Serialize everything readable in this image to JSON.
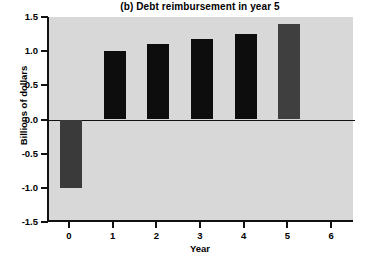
{
  "chart_data": {
    "type": "bar",
    "title": "(b) Debt reimbursement in year 5",
    "xlabel": "Year",
    "ylabel": "Billions of dollars",
    "categories": [
      "0",
      "1",
      "2",
      "3",
      "4",
      "5",
      "6"
    ],
    "values": [
      -1.0,
      1.0,
      1.1,
      1.18,
      1.25,
      1.4,
      0
    ],
    "bar_colors": [
      "#3a3a3a",
      "#0d0d0d",
      "#0d0d0d",
      "#0d0d0d",
      "#0d0d0d",
      "#3f3f3f",
      "#d8d8d8"
    ],
    "ylim": [
      -1.5,
      1.5
    ],
    "xlim": [
      -0.5,
      6.5
    ],
    "ytick_labels": [
      "1.5",
      "1.0",
      "0.5",
      "0.0",
      "-0.5",
      "-1.0",
      "-1.5"
    ],
    "ytick_values": [
      1.5,
      1.0,
      0.5,
      0.0,
      -0.5,
      -1.0,
      -1.5
    ],
    "xtick_labels": [
      "0",
      "1",
      "2",
      "3",
      "4",
      "5",
      "6"
    ],
    "grid": false,
    "legend": null,
    "plot_background": "#d8d8d8",
    "axis_color": "#111111"
  }
}
